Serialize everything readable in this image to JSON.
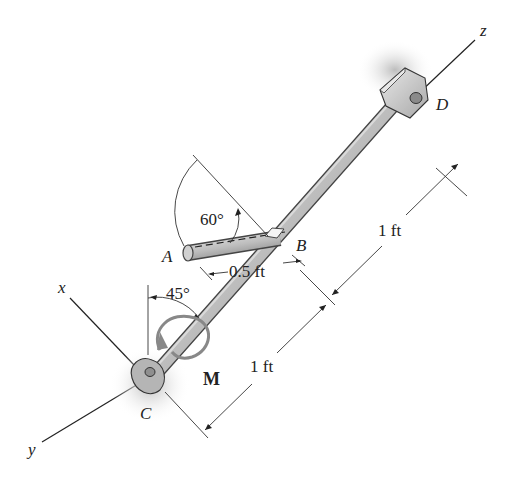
{
  "figure": {
    "axes": {
      "x_label": "x",
      "y_label": "y",
      "z_label": "z"
    },
    "points": {
      "A": "A",
      "B": "B",
      "C": "C",
      "D": "D"
    },
    "moment_label": "M",
    "angles": {
      "angle_60": "60°",
      "angle_45": "45°"
    },
    "dimensions": {
      "ab_length": "0.5 ft",
      "bd_length": "1 ft",
      "cb_length": "1 ft"
    },
    "colors": {
      "rod": "#b8b8b8",
      "rod_edge": "#444444",
      "support_shadow": "#c8c8c8",
      "line": "#333333"
    }
  }
}
